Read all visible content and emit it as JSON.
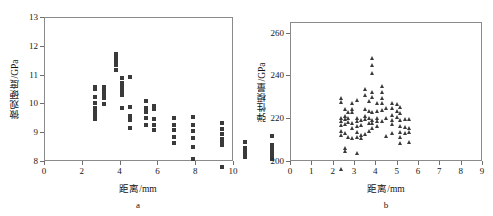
{
  "figure": {
    "panels": [
      {
        "letter": "a",
        "axis_title_x": "距离/mm",
        "axis_title_y": "微观硬度/GPa"
      },
      {
        "letter": "b",
        "axis_title_x": "距离/mm",
        "axis_title_y": "弹性模量/GPa"
      }
    ]
  },
  "chart_data": [
    {
      "type": "scatter",
      "title": "",
      "panel": "a",
      "xlabel": "距离/mm",
      "ylabel": "微观硬度/GPa",
      "xlim": [
        0,
        10
      ],
      "ylim": [
        8,
        13
      ],
      "xticks": [
        0,
        2,
        4,
        6,
        8,
        10
      ],
      "yticks": [
        8,
        9,
        10,
        11,
        12,
        13
      ],
      "xticklabels": [
        "0",
        "2",
        "4",
        "6",
        "8",
        "10"
      ],
      "yticklabels": [
        "8",
        "9",
        "10",
        "11",
        "12",
        "13"
      ],
      "grid": false,
      "legend": null,
      "marker": "square",
      "marker_color": "#3a3a3a",
      "series": [
        {
          "name": "微观硬度",
          "x": [
            0.3,
            0.3,
            0.3,
            0.3,
            0.3,
            0.3,
            0.3,
            0.3,
            0.78,
            0.78,
            0.78,
            0.78,
            0.78,
            0.78,
            0.78,
            1.45,
            1.45,
            1.45,
            1.45,
            1.45,
            1.45,
            1.72,
            1.72,
            1.72,
            1.72,
            1.72,
            1.72,
            2.18,
            2.18,
            2.18,
            2.18,
            2.18,
            3.0,
            3.0,
            3.0,
            3.0,
            3.0,
            3.45,
            3.45,
            3.45,
            3.45,
            3.45,
            4.48,
            4.48,
            4.48,
            4.48,
            4.48,
            5.52,
            5.52,
            5.52,
            5.52,
            5.52,
            5.52,
            7.02,
            7.02,
            7.02,
            7.02,
            7.02,
            7.02,
            7.02,
            8.28,
            8.28,
            8.28,
            8.28,
            8.28,
            9.7,
            9.7,
            9.7,
            9.7,
            9.7,
            9.7,
            9.7
          ],
          "y": [
            11.2,
            11.12,
            10.83,
            10.63,
            10.45,
            10.33,
            10.2,
            10.08,
            11.2,
            11.1,
            11.02,
            10.95,
            10.88,
            10.8,
            10.62,
            12.35,
            12.25,
            12.15,
            12.05,
            11.95,
            11.78,
            11.5,
            11.32,
            11.18,
            11.05,
            10.92,
            10.48,
            11.55,
            10.5,
            10.18,
            10.05,
            9.78,
            10.72,
            10.48,
            10.32,
            10.12,
            9.88,
            10.55,
            10.42,
            10.1,
            9.88,
            9.7,
            10.12,
            9.88,
            9.7,
            9.45,
            9.25,
            10.15,
            9.88,
            9.65,
            9.42,
            9.12,
            8.68,
            9.95,
            9.72,
            9.55,
            9.4,
            9.25,
            9.18,
            8.4,
            9.28,
            9.08,
            8.98,
            8.88,
            8.78,
            9.48,
            9.18,
            9.08,
            8.98,
            8.88,
            8.78,
            8.68
          ]
        }
      ]
    },
    {
      "type": "scatter",
      "title": "",
      "panel": "b",
      "xlabel": "距离/mm",
      "ylabel": "弹性模量/GPa",
      "xlim": [
        0,
        9
      ],
      "ylim": [
        200,
        265
      ],
      "xticks": [
        0,
        1,
        2,
        3,
        4,
        5,
        6,
        7,
        8,
        9
      ],
      "yticks": [
        200,
        220,
        240,
        260
      ],
      "xticklabels": [
        "0",
        "1",
        "2",
        "3",
        "4",
        "5",
        "6",
        "7",
        "8",
        "9"
      ],
      "yticklabels": [
        "200",
        "220",
        "240",
        "260"
      ],
      "grid": false,
      "legend": null,
      "marker": "triangle",
      "marker_color": "#3a3a3a",
      "series": [
        {
          "name": "弹性模量",
          "x": [
            0.28,
            0.28,
            0.28,
            0.28,
            0.28,
            0.28,
            0.28,
            0.28,
            0.45,
            0.45,
            0.45,
            0.45,
            0.45,
            0.45,
            0.45,
            0.62,
            0.62,
            0.62,
            0.62,
            0.82,
            0.82,
            0.82,
            0.82,
            0.82,
            0.82,
            1.02,
            1.02,
            1.02,
            1.02,
            1.02,
            1.02,
            1.02,
            1.22,
            1.22,
            1.22,
            1.22,
            1.42,
            1.42,
            1.42,
            1.42,
            1.42,
            1.42,
            1.6,
            1.6,
            1.6,
            1.6,
            1.6,
            1.75,
            1.75,
            1.75,
            1.75,
            1.75,
            1.75,
            1.75,
            1.75,
            1.75,
            1.95,
            1.95,
            1.95,
            1.95,
            1.95,
            2.18,
            2.18,
            2.18,
            2.18,
            2.18,
            2.18,
            2.38,
            2.38,
            2.38,
            2.68,
            2.68,
            2.68,
            2.68,
            2.68,
            2.68,
            2.9,
            2.9,
            2.9,
            3.05,
            3.05,
            3.05,
            3.05,
            3.05,
            3.05,
            3.05,
            3.3,
            3.3,
            3.3,
            3.48,
            3.48,
            3.48,
            3.48,
            8.38,
            8.38,
            8.38,
            8.38,
            8.38,
            8.38,
            8.38,
            8.38,
            8.38
          ],
          "y": [
            240.0,
            238.5,
            231.0,
            229.5,
            227.5,
            225.0,
            223.0,
            207.0,
            235.0,
            232.0,
            230.5,
            228.0,
            224.0,
            217.0,
            215.5,
            233.5,
            231.0,
            229.0,
            222.0,
            238.0,
            235.0,
            233.5,
            228.5,
            226.0,
            221.5,
            239.5,
            231.0,
            229.5,
            227.0,
            224.5,
            222.0,
            214.5,
            230.0,
            227.5,
            223.0,
            221.5,
            244.5,
            241.5,
            235.0,
            232.0,
            230.5,
            223.5,
            239.0,
            234.0,
            231.0,
            228.5,
            225.0,
            259.0,
            255.5,
            252.0,
            243.0,
            240.5,
            233.5,
            230.0,
            228.5,
            226.0,
            238.0,
            234.0,
            231.0,
            229.5,
            227.0,
            246.0,
            243.0,
            240.0,
            238.0,
            234.5,
            229.5,
            235.5,
            231.0,
            222.5,
            238.0,
            235.5,
            232.5,
            230.0,
            228.0,
            224.0,
            237.5,
            234.0,
            231.5,
            236.0,
            233.0,
            230.0,
            227.0,
            224.5,
            222.0,
            219.0,
            230.5,
            226.5,
            224.0,
            230.5,
            226.0,
            224.5,
            219.5,
            248.5,
            245.0,
            240.5,
            238.5,
            236.5,
            235.0,
            233.0,
            231.5,
            219.0
          ]
        }
      ]
    }
  ]
}
